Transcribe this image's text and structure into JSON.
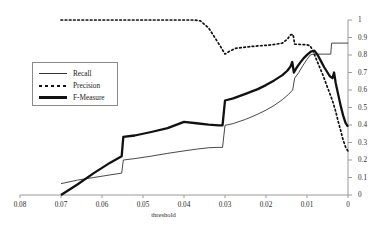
{
  "chart_data": {
    "type": "line",
    "title": "",
    "xlabel": "threshold",
    "ylabel": "",
    "xlim": [
      0.08,
      0
    ],
    "ylim": [
      0,
      1
    ],
    "x_inverted": true,
    "grid": false,
    "y_axis_position": "right",
    "legend_position": "left-middle",
    "xticks": [
      "0.08",
      "0.07",
      "0.06",
      "0.05",
      "0.04",
      "0.03",
      "0.02",
      "0.01",
      "0"
    ],
    "xtick_values": [
      0.08,
      0.07,
      0.06,
      0.05,
      0.04,
      0.03,
      0.02,
      0.01,
      0
    ],
    "yticks": [
      "0",
      "0.1",
      "0.2",
      "0.3",
      "0.4",
      "0.5",
      "0.6",
      "0.7",
      "0.8",
      "0.9",
      "1"
    ],
    "ytick_values": [
      0,
      0.1,
      0.2,
      0.3,
      0.4,
      0.5,
      0.6,
      0.7,
      0.8,
      0.9,
      1
    ],
    "series": [
      {
        "name": "Recall",
        "style": "thin-solid",
        "color": "#333333",
        "points": [
          [
            0.07,
            0.065
          ],
          [
            0.066,
            0.085
          ],
          [
            0.062,
            0.1
          ],
          [
            0.058,
            0.115
          ],
          [
            0.0552,
            0.125
          ],
          [
            0.0548,
            0.2
          ],
          [
            0.052,
            0.208
          ],
          [
            0.048,
            0.222
          ],
          [
            0.044,
            0.238
          ],
          [
            0.04,
            0.252
          ],
          [
            0.037,
            0.262
          ],
          [
            0.034,
            0.27
          ],
          [
            0.032,
            0.272
          ],
          [
            0.0306,
            0.272
          ],
          [
            0.03,
            0.398
          ],
          [
            0.028,
            0.408
          ],
          [
            0.025,
            0.432
          ],
          [
            0.022,
            0.462
          ],
          [
            0.02,
            0.485
          ],
          [
            0.018,
            0.512
          ],
          [
            0.016,
            0.545
          ],
          [
            0.0145,
            0.575
          ],
          [
            0.0135,
            0.6
          ],
          [
            0.013,
            0.668
          ],
          [
            0.012,
            0.7
          ],
          [
            0.011,
            0.74
          ],
          [
            0.01,
            0.775
          ],
          [
            0.0092,
            0.8
          ],
          [
            0.0085,
            0.805
          ],
          [
            0.006,
            0.805
          ],
          [
            0.0042,
            0.805
          ],
          [
            0.004,
            0.868
          ],
          [
            0.002,
            0.868
          ],
          [
            0.0,
            0.868
          ]
        ]
      },
      {
        "name": "Precision",
        "style": "dotted",
        "color": "#111111",
        "points": [
          [
            0.07,
            1.0
          ],
          [
            0.06,
            1.0
          ],
          [
            0.05,
            1.0
          ],
          [
            0.042,
            1.0
          ],
          [
            0.0375,
            1.0
          ],
          [
            0.036,
            0.995
          ],
          [
            0.034,
            0.955
          ],
          [
            0.0325,
            0.9
          ],
          [
            0.031,
            0.845
          ],
          [
            0.03,
            0.805
          ],
          [
            0.029,
            0.82
          ],
          [
            0.0275,
            0.838
          ],
          [
            0.025,
            0.845
          ],
          [
            0.022,
            0.852
          ],
          [
            0.02,
            0.855
          ],
          [
            0.018,
            0.86
          ],
          [
            0.016,
            0.868
          ],
          [
            0.0148,
            0.89
          ],
          [
            0.014,
            0.915
          ],
          [
            0.0134,
            0.918
          ],
          [
            0.013,
            0.862
          ],
          [
            0.0115,
            0.86
          ],
          [
            0.01,
            0.858
          ],
          [
            0.0092,
            0.852
          ],
          [
            0.0085,
            0.82
          ],
          [
            0.0078,
            0.78
          ],
          [
            0.007,
            0.735
          ],
          [
            0.0062,
            0.69
          ],
          [
            0.0054,
            0.64
          ],
          [
            0.0046,
            0.59
          ],
          [
            0.0038,
            0.54
          ],
          [
            0.003,
            0.478
          ],
          [
            0.0024,
            0.42
          ],
          [
            0.0018,
            0.37
          ],
          [
            0.0012,
            0.315
          ],
          [
            0.0006,
            0.275
          ],
          [
            0.0,
            0.25
          ]
        ]
      },
      {
        "name": "F-Measure",
        "style": "thick-solid",
        "color": "#111111",
        "points": [
          [
            0.07,
            0.0
          ],
          [
            0.066,
            0.06
          ],
          [
            0.062,
            0.125
          ],
          [
            0.058,
            0.185
          ],
          [
            0.0552,
            0.222
          ],
          [
            0.0548,
            0.332
          ],
          [
            0.052,
            0.34
          ],
          [
            0.048,
            0.36
          ],
          [
            0.044,
            0.382
          ],
          [
            0.04,
            0.418
          ],
          [
            0.037,
            0.41
          ],
          [
            0.034,
            0.402
          ],
          [
            0.0315,
            0.398
          ],
          [
            0.0306,
            0.398
          ],
          [
            0.03,
            0.54
          ],
          [
            0.028,
            0.552
          ],
          [
            0.025,
            0.578
          ],
          [
            0.022,
            0.605
          ],
          [
            0.02,
            0.628
          ],
          [
            0.018,
            0.655
          ],
          [
            0.016,
            0.685
          ],
          [
            0.0148,
            0.71
          ],
          [
            0.014,
            0.735
          ],
          [
            0.0136,
            0.76
          ],
          [
            0.0132,
            0.7
          ],
          [
            0.0126,
            0.725
          ],
          [
            0.0118,
            0.752
          ],
          [
            0.0108,
            0.782
          ],
          [
            0.0098,
            0.805
          ],
          [
            0.009,
            0.82
          ],
          [
            0.0082,
            0.825
          ],
          [
            0.0074,
            0.8
          ],
          [
            0.0066,
            0.765
          ],
          [
            0.0058,
            0.73
          ],
          [
            0.005,
            0.7
          ],
          [
            0.0044,
            0.678
          ],
          [
            0.0038,
            0.668
          ],
          [
            0.0034,
            0.7
          ],
          [
            0.003,
            0.64
          ],
          [
            0.0024,
            0.575
          ],
          [
            0.0018,
            0.512
          ],
          [
            0.0012,
            0.455
          ],
          [
            0.0006,
            0.412
          ],
          [
            0.0,
            0.39
          ]
        ]
      }
    ],
    "legend": [
      {
        "label": "Recall",
        "style": "thin-solid"
      },
      {
        "label": "Precision",
        "style": "dotted"
      },
      {
        "label": "F-Measure",
        "style": "thick-solid"
      }
    ]
  }
}
